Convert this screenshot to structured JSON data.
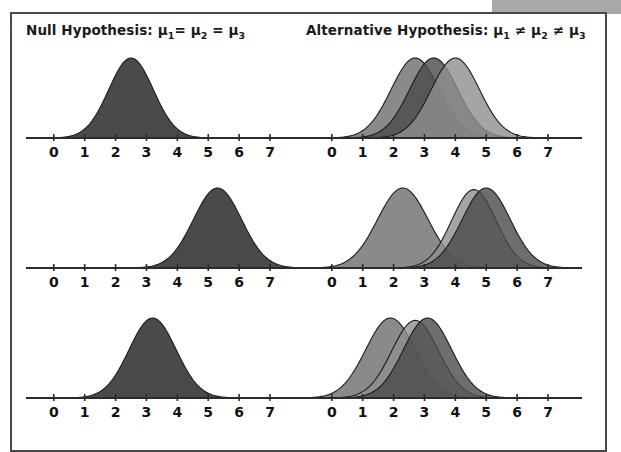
{
  "figure": {
    "background": "#ffffff",
    "frame_color": "#4a4a4a",
    "corner_block_color": "#a8a8a8"
  },
  "columns": [
    {
      "id": "null-hypothesis",
      "title_prefix": "Null Hypothesis:",
      "title_full": "Null Hypothesis: μ1 = μ2 = μ3",
      "relation": "=",
      "mu1": "μ",
      "mu1_sub": "1",
      "mu2": "μ",
      "mu2_sub": "2",
      "mu3": "μ",
      "mu3_sub": "3"
    },
    {
      "id": "alternative-hypothesis",
      "title_prefix": "Alternative Hypothesis:",
      "title_full": "Alternative Hypothesis: μ1 ≠ μ2 ≠ μ3",
      "relation": "≠",
      "mu1": "μ",
      "mu1_sub": "1",
      "mu2": "μ",
      "mu2_sub": "2",
      "mu3": "μ",
      "mu3_sub": "3"
    }
  ],
  "axis": {
    "ticks": [
      0,
      1,
      2,
      3,
      4,
      5,
      6,
      7
    ],
    "tick_labels": [
      "0",
      "1",
      "2",
      "3",
      "4",
      "5",
      "6",
      "7"
    ],
    "xmin": -0.9,
    "xmax": 8.1,
    "axis_color": "#2b2b2b",
    "label_color": "#111111"
  },
  "colors": {
    "curve_dark": "#4a4a4a",
    "curve_mid": "#6d6d6d",
    "curve_light": "#8f8f8f",
    "curve_stroke": "#1c1c1c"
  },
  "chart_data": {
    "type": "area",
    "xlabel": "",
    "ylabel": "",
    "xlim": [
      -0.9,
      8.1
    ],
    "ylim": [
      0,
      1
    ],
    "grid": false,
    "legend": "none",
    "panels": [
      {
        "row": 1,
        "column": "null",
        "column_label": "Null Hypothesis",
        "curves": [
          {
            "name": "mu1",
            "mean": 2.5,
            "sd": 0.72,
            "peak": 1.0,
            "fill": "#4a4a4a"
          }
        ]
      },
      {
        "row": 1,
        "column": "alternative",
        "column_label": "Alternative Hypothesis",
        "curves": [
          {
            "name": "mu1",
            "mean": 2.7,
            "sd": 0.78,
            "peak": 1.0,
            "fill": "#6d6d6d"
          },
          {
            "name": "mu2",
            "mean": 3.3,
            "sd": 0.78,
            "peak": 1.0,
            "fill": "#4a4a4a"
          },
          {
            "name": "mu3",
            "mean": 4.0,
            "sd": 0.78,
            "peak": 1.0,
            "fill": "#8f8f8f"
          }
        ]
      },
      {
        "row": 2,
        "column": "null",
        "column_label": "Null Hypothesis",
        "curves": [
          {
            "name": "mu1",
            "mean": 5.3,
            "sd": 0.78,
            "peak": 1.0,
            "fill": "#4a4a4a"
          }
        ]
      },
      {
        "row": 2,
        "column": "alternative",
        "column_label": "Alternative Hypothesis",
        "curves": [
          {
            "name": "mu1",
            "mean": 2.3,
            "sd": 0.82,
            "peak": 1.0,
            "fill": "#6d6d6d"
          },
          {
            "name": "mu2",
            "mean": 4.6,
            "sd": 0.72,
            "peak": 0.98,
            "fill": "#8f8f8f"
          },
          {
            "name": "mu3",
            "mean": 5.0,
            "sd": 0.78,
            "peak": 1.0,
            "fill": "#4a4a4a"
          }
        ]
      },
      {
        "row": 3,
        "column": "null",
        "column_label": "Null Hypothesis",
        "curves": [
          {
            "name": "mu1",
            "mean": 3.2,
            "sd": 0.76,
            "peak": 1.0,
            "fill": "#4a4a4a"
          }
        ]
      },
      {
        "row": 3,
        "column": "alternative",
        "column_label": "Alternative Hypothesis",
        "curves": [
          {
            "name": "mu1",
            "mean": 1.9,
            "sd": 0.8,
            "peak": 1.0,
            "fill": "#6d6d6d"
          },
          {
            "name": "mu2",
            "mean": 2.7,
            "sd": 0.76,
            "peak": 0.97,
            "fill": "#8f8f8f"
          },
          {
            "name": "mu3",
            "mean": 3.1,
            "sd": 0.78,
            "peak": 1.0,
            "fill": "#4a4a4a"
          }
        ]
      }
    ]
  }
}
